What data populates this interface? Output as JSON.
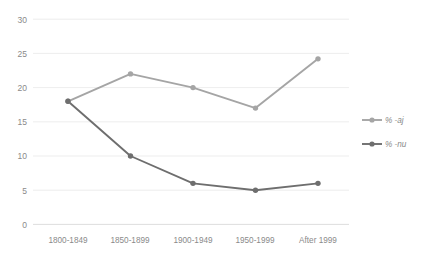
{
  "chart_data": {
    "type": "line",
    "title": "",
    "subtitle": "",
    "xlabel": "",
    "ylabel": "",
    "categories": [
      "1800-1849",
      "1850-1899",
      "1900-1949",
      "1950-1999",
      "After 1999"
    ],
    "series": [
      {
        "name": "% -aj",
        "values": [
          18,
          22,
          20,
          17,
          24.2
        ],
        "color": "#a5a5a5"
      },
      {
        "name": "% -nu",
        "values": [
          18,
          10,
          6,
          5,
          6
        ],
        "color": "#6e6e6e"
      }
    ],
    "ylim": [
      0,
      30
    ],
    "yticks": [
      0,
      5,
      10,
      15,
      20,
      25,
      30
    ],
    "ytick_labels": [
      "0",
      "5",
      "10",
      "15",
      "20",
      "25",
      "30"
    ],
    "grid": "horizontal",
    "legend_position": "right",
    "gridline_color": "#e8e8e8",
    "axis_color": "#d9d9d9",
    "tick_text_color": "#8a8a8a"
  },
  "legend": {
    "entries": [
      {
        "label": "% -aj",
        "color": "#a5a5a5"
      },
      {
        "label": "% -nu",
        "color": "#6e6e6e"
      }
    ]
  }
}
